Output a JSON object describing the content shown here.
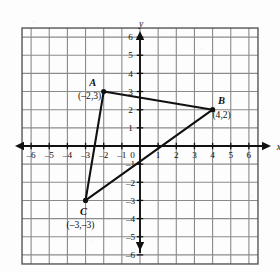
{
  "chart_data": {
    "type": "scatter",
    "title": "",
    "xlabel": "x",
    "ylabel": "y",
    "xlim": [
      -6.5,
      6.5
    ],
    "ylim": [
      -6.5,
      6.5
    ],
    "grid": true,
    "legend": "none",
    "x_ticks": [
      -6,
      -5,
      -4,
      -3,
      -2,
      -1,
      0,
      1,
      2,
      3,
      4,
      5,
      6
    ],
    "y_ticks": [
      -6,
      -5,
      -4,
      -3,
      -2,
      -1,
      1,
      2,
      3,
      4,
      5,
      6
    ],
    "x_tick_labels": [
      "–6",
      "–5",
      "–4",
      "–3",
      "–2",
      "–1",
      "0",
      "1",
      "2",
      "3",
      "4",
      "5",
      "6"
    ],
    "y_tick_labels": [
      "–6",
      "–5",
      "–4",
      "–3",
      "–2",
      "–1",
      "1",
      "2",
      "3",
      "4",
      "5",
      "6"
    ],
    "origin_label": "0",
    "shape": "triangle",
    "points": [
      {
        "name": "A",
        "x": -2,
        "y": 3,
        "label": "A",
        "coord_label": "(–2,3)"
      },
      {
        "name": "B",
        "x": 4,
        "y": 2,
        "label": "B",
        "coord_label": "(4,2)"
      },
      {
        "name": "C",
        "x": -3,
        "y": -3,
        "label": "C",
        "coord_label": "(–3,–3)"
      }
    ],
    "edges": [
      [
        "A",
        "B"
      ],
      [
        "B",
        "C"
      ],
      [
        "C",
        "A"
      ]
    ]
  },
  "axis_labels": {
    "x": "x",
    "y": "y"
  },
  "colors": {
    "grid": "#8a8a8a",
    "axis": "#111111",
    "shape": "#111111",
    "background": "#fdfdfd",
    "text": "#111111"
  }
}
